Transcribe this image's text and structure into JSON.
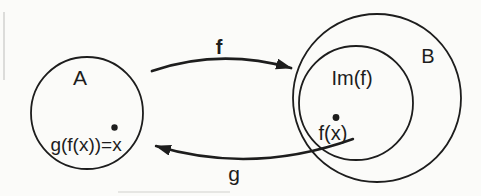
{
  "colors": {
    "ink": "#1d1d1d",
    "background": "#fbfbf9"
  },
  "sets": {
    "a": {
      "label": "A"
    },
    "b": {
      "label": "B"
    },
    "image": {
      "label": "Im(f)"
    }
  },
  "arrows": {
    "f": {
      "label": "f"
    },
    "g": {
      "label": "g"
    }
  },
  "points": {
    "x": {
      "label": "g(f(x))=x"
    },
    "fx": {
      "label": "f(x)"
    }
  }
}
